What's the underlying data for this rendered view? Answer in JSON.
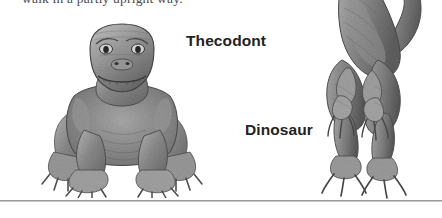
{
  "page": {
    "background_color": "#ffffff",
    "width": 442,
    "height": 218
  },
  "body_text": {
    "line": "walk in a partly upright way."
  },
  "figure": {
    "labels": [
      {
        "id": "thecodont",
        "text": "Thecodont",
        "color": "#232323"
      },
      {
        "id": "dinosaur",
        "text": "Dinosaur",
        "color": "#232323"
      }
    ],
    "illustrations": [
      {
        "id": "thecodont",
        "subject": "thecodont-reptile-illustration",
        "description": "Sprawling quadrupedal crocodile-like reptile facing the viewer",
        "style": "grayscale pencil drawing",
        "posture": "quadrupedal sprawling"
      },
      {
        "id": "dinosaur",
        "subject": "theropod-dinosaur-illustration",
        "description": "Bipedal theropod dinosaur standing upright, hind legs and clawed feet, curving tail",
        "style": "grayscale pencil drawing",
        "posture": "bipedal upright"
      }
    ]
  },
  "rule": {
    "color": "#9a9a9a"
  }
}
